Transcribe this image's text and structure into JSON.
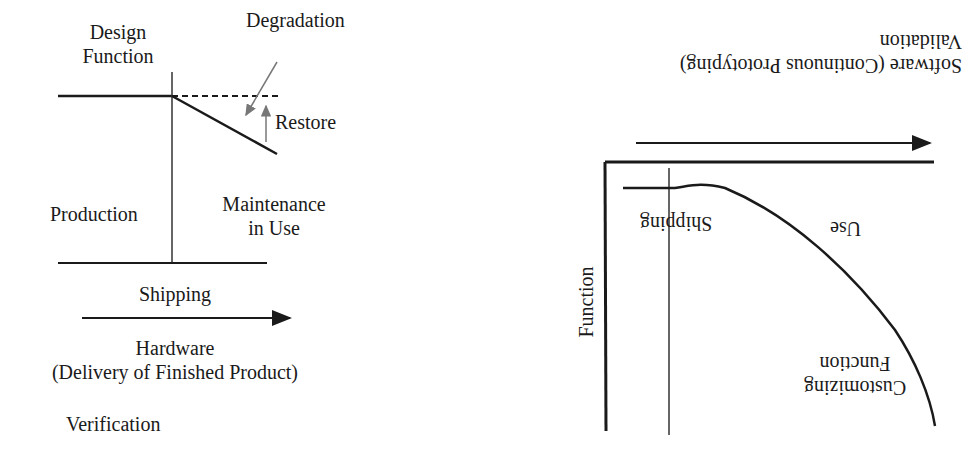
{
  "left_diagram": {
    "design_function": [
      "Design",
      "Function"
    ],
    "degradation": "Degradation",
    "restore": "Restore",
    "production": "Production",
    "maintenance": [
      "Maintenance",
      "in Use"
    ],
    "shipping": "Shipping",
    "hardware": [
      "Hardware",
      "(Delivery of Finished Product)"
    ],
    "verification": "Verification"
  },
  "right_diagram": {
    "software": "Software (Continuous Prototyping)",
    "validation": "Validation",
    "shipping": "Shipping",
    "use": "Use",
    "function": "Function",
    "customizing": [
      "Customizing",
      "Function"
    ]
  },
  "colors": {
    "ink": "#1a1a1a",
    "gray_arrow": "#777777"
  }
}
